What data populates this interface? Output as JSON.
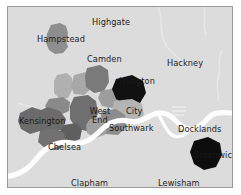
{
  "figure": {
    "kind": "choropleth-map",
    "background_color": "#dcdcdc",
    "border_color": "#9a9a9a",
    "river_color": "#fdfdfd",
    "label_color": "#1b1b1b"
  },
  "labels": {
    "highgate": "Highgate",
    "hampstead": "Hampstead",
    "camden": "Camden",
    "hackney": "Hackney",
    "islington": "Islington",
    "kensington": "Kensington",
    "west_end": "West End",
    "city": "City",
    "southwark": "Southwark",
    "docklands": "Docklands",
    "chelsea": "Chelsea",
    "greenwich": "Greenwich",
    "clapham": "Clapham",
    "lewisham": "Lewisham"
  },
  "regions": [
    {
      "name": "hampstead",
      "label": "Hampstead",
      "fill": "#8e8e8e"
    },
    {
      "name": "islington",
      "label": "Islington",
      "fill": "#111111"
    },
    {
      "name": "city",
      "label": "City",
      "fill": "#b4b4b4"
    },
    {
      "name": "southwark",
      "label": "Southwark",
      "fill": "#8c8c8c"
    },
    {
      "name": "west-end",
      "label": "West End",
      "fill": "#6f6f6f"
    },
    {
      "name": "kensington",
      "label": "Kensington",
      "fill": "#6b6b6b"
    },
    {
      "name": "chelsea",
      "label": "Chelsea",
      "fill": "#717171"
    },
    {
      "name": "greenwich",
      "label": "Greenwich",
      "fill": "#0d0d0d"
    },
    {
      "name": "marylebone",
      "label": "",
      "fill": "#a8a8a8"
    },
    {
      "name": "fitzrovia",
      "label": "",
      "fill": "#7a7a7a"
    },
    {
      "name": "holborn",
      "label": "",
      "fill": "#9d9d9d"
    },
    {
      "name": "lambeth",
      "label": "",
      "fill": "#a0a0a0"
    },
    {
      "name": "paddington",
      "label": "",
      "fill": "#b0b0b0"
    },
    {
      "name": "notting-hill",
      "label": "",
      "fill": "#8a8a8a"
    },
    {
      "name": "pimlico",
      "label": "",
      "fill": "#5f5f5f"
    }
  ],
  "water": {
    "name": "River Thames",
    "fill": "#fdfdfd"
  }
}
